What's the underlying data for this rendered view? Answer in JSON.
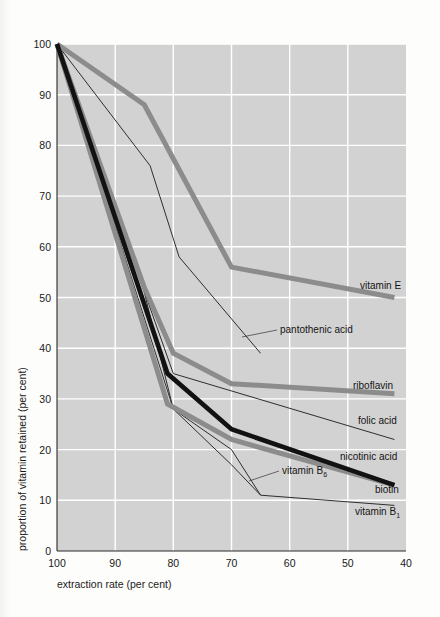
{
  "chart_data": {
    "type": "line",
    "title": "",
    "xlabel": "extraction rate (per cent)",
    "ylabel": "proportion of vitamin retained (per cent)",
    "xlim": [
      100,
      40
    ],
    "ylim": [
      0,
      100
    ],
    "x_ticks": [
      "100",
      "90",
      "80",
      "70",
      "60",
      "50",
      "40"
    ],
    "y_ticks": [
      "0",
      "10",
      "20",
      "30",
      "40",
      "50",
      "60",
      "70",
      "80",
      "90",
      "100"
    ],
    "grid": true,
    "legend": "inline-labels-right",
    "background": "#d2d2d2",
    "series": [
      {
        "name": "vitamin E",
        "style": "thick-gray",
        "color": "#8c8c8c",
        "points": [
          [
            100,
            100
          ],
          [
            85,
            88
          ],
          [
            70,
            56
          ],
          [
            42,
            50
          ]
        ]
      },
      {
        "name": "riboflavin",
        "style": "thick-gray",
        "color": "#8c8c8c",
        "points": [
          [
            100,
            100
          ],
          [
            85,
            52
          ],
          [
            80,
            39
          ],
          [
            70,
            33
          ],
          [
            42,
            31
          ]
        ]
      },
      {
        "name": "nicotinic acid",
        "style": "thick-black",
        "color": "#121212",
        "points": [
          [
            100,
            100
          ],
          [
            81,
            35
          ],
          [
            70,
            24
          ],
          [
            42,
            13
          ]
        ]
      },
      {
        "name": "biotin",
        "style": "thick-gray",
        "color": "#8c8c8c",
        "points": [
          [
            100,
            100
          ],
          [
            81,
            29
          ],
          [
            70,
            22
          ],
          [
            42,
            13
          ]
        ]
      },
      {
        "name": "pantothenic acid",
        "style": "thin",
        "color": "#2e2e2e",
        "points": [
          [
            100,
            100
          ],
          [
            84,
            76
          ],
          [
            79,
            58
          ],
          [
            65,
            39
          ]
        ]
      },
      {
        "name": "folic acid",
        "style": "thin",
        "color": "#2e2e2e",
        "points": [
          [
            100,
            100
          ],
          [
            80,
            35
          ],
          [
            42,
            22
          ]
        ]
      },
      {
        "name": "vitamin B6",
        "style": "thin",
        "color": "#2e2e2e",
        "points": [
          [
            100,
            100
          ],
          [
            80,
            28
          ],
          [
            70,
            17
          ],
          [
            65,
            11
          ]
        ]
      },
      {
        "name": "vitamin B1",
        "style": "thin",
        "color": "#2e2e2e",
        "points": [
          [
            100,
            100
          ],
          [
            85,
            51
          ],
          [
            80,
            28
          ],
          [
            70,
            20
          ],
          [
            65,
            11
          ],
          [
            42,
            9
          ]
        ]
      }
    ],
    "annotations": [
      {
        "id": "vitamin-e",
        "text": "vitamin E",
        "x": 360,
        "y": 289
      },
      {
        "id": "pantothenic-acid",
        "text": "pantothenic acid",
        "x": 280,
        "y": 333
      },
      {
        "id": "riboflavin",
        "text": "riboflavin",
        "x": 353,
        "y": 389
      },
      {
        "id": "folic-acid",
        "text": "folic acid",
        "x": 358,
        "y": 424
      },
      {
        "id": "nicotinic-acid",
        "text": "nicotinic acid",
        "x": 340,
        "y": 460
      },
      {
        "id": "vitamin-b6",
        "text": "vitamin B",
        "sub": "6",
        "x": 282,
        "y": 474
      },
      {
        "id": "biotin",
        "text": "biotin",
        "x": 375,
        "y": 493
      },
      {
        "id": "vitamin-b1",
        "text": "vitamin B",
        "sub": "1",
        "x": 355,
        "y": 515
      }
    ]
  }
}
